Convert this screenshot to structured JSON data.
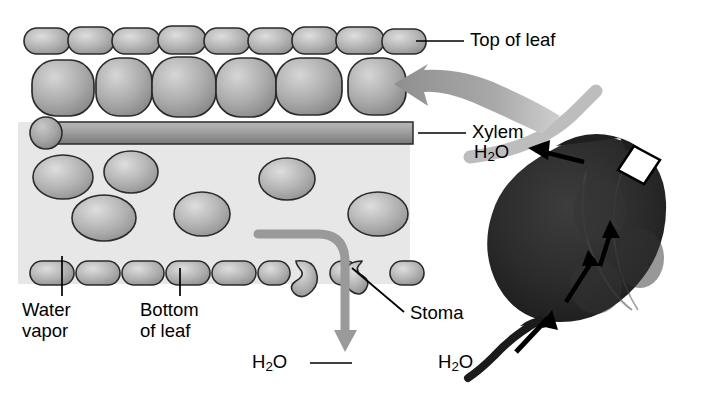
{
  "figure": {
    "type": "biological-diagram"
  },
  "labels": {
    "top_of_leaf": "Top of leaf",
    "xylem": "Xylem",
    "water_vapor": "Water\nvapor",
    "bottom_of_leaf": "Bottom\nof leaf",
    "stoma": "Stoma",
    "h2o_cross_section": "H",
    "h2o_cross_section_sub": "2",
    "h2o_cross_section_end": "O",
    "h2o_leaf_top": "H",
    "h2o_leaf_top_sub": "2",
    "h2o_leaf_top_end": "O",
    "h2o_stem": "H",
    "h2o_stem_sub": "2",
    "h2o_stem_end": "O"
  },
  "colors": {
    "cell_light": "#d8d8d8",
    "cell_mid": "#a8a8a8",
    "cell_dark": "#8c8c8c",
    "cell_stroke": "#2b2b2b",
    "airspace": "#e6e6e6",
    "arrow_gray": "#9a9a9a",
    "arrow_gray_light": "#bdbdbd",
    "leaf_dark": "#262626",
    "leaf_mid": "#3a3a3a",
    "background": "#ffffff",
    "text": "#000000"
  },
  "structures": {
    "upper_epidermis_count": 9,
    "palisade_count": 6,
    "lower_epidermis_count": 8,
    "spongy_mesophyll_count": 7,
    "stoma_count": 2,
    "xylem_label": "Xylem vessel tube"
  }
}
